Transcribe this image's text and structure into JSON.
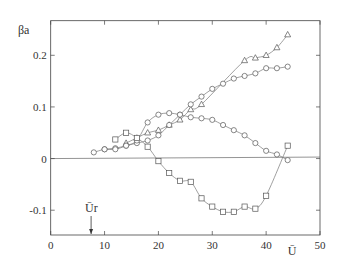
{
  "chart_data": {
    "type": "scatter",
    "title": "",
    "xlabel": "Ū",
    "ylabel": "βa",
    "xlim": [
      0,
      50
    ],
    "ylim": [
      -0.148,
      0.267
    ],
    "xticks": [
      0,
      10,
      20,
      30,
      40,
      50
    ],
    "xtick_labels": [
      "0",
      "10",
      "20",
      "30",
      "40",
      "50"
    ],
    "yticks": [
      -0.1,
      0,
      0.1,
      0.2
    ],
    "ytick_labels": [
      "-0.1",
      "0",
      "0.1",
      "0.2"
    ],
    "grid": false,
    "zero_line": true,
    "annotations": [
      {
        "text": "Ūr",
        "x": 7.5,
        "arrow": "down-to-x-axis"
      }
    ],
    "series": [
      {
        "name": "triangles",
        "marker": "triangle",
        "x": [
          14,
          16,
          18,
          20,
          22,
          24,
          26,
          28,
          36,
          38,
          40,
          42,
          44
        ],
        "y": [
          0.03,
          0.04,
          0.05,
          0.055,
          0.065,
          0.075,
          0.095,
          0.105,
          0.19,
          0.195,
          0.2,
          0.215,
          0.24
        ]
      },
      {
        "name": "circles-rising",
        "marker": "circle",
        "x": [
          8,
          10,
          12,
          14,
          16,
          18,
          20,
          22,
          24,
          26,
          28,
          30,
          32,
          34,
          36,
          38,
          40,
          42,
          44
        ],
        "y": [
          0.012,
          0.018,
          0.02,
          0.025,
          0.03,
          0.035,
          0.045,
          0.065,
          0.085,
          0.105,
          0.12,
          0.135,
          0.145,
          0.155,
          0.16,
          0.165,
          0.175,
          0.175,
          0.178
        ]
      },
      {
        "name": "circles-hump",
        "marker": "circle",
        "x": [
          10,
          12,
          14,
          16,
          18,
          20,
          22,
          24,
          26,
          28,
          30,
          32,
          34,
          36,
          38,
          40,
          42,
          44
        ],
        "y": [
          0.018,
          0.018,
          0.025,
          0.035,
          0.07,
          0.085,
          0.088,
          0.085,
          0.08,
          0.078,
          0.075,
          0.065,
          0.055,
          0.045,
          0.03,
          0.015,
          0.008,
          -0.003
        ]
      },
      {
        "name": "squares",
        "marker": "square",
        "x": [
          12,
          14,
          16,
          18,
          20,
          22,
          24,
          26,
          28,
          30,
          32,
          34,
          36,
          38,
          40,
          44
        ],
        "y": [
          0.037,
          0.05,
          0.04,
          0.023,
          -0.005,
          -0.028,
          -0.043,
          -0.045,
          -0.077,
          -0.093,
          -0.103,
          -0.103,
          -0.093,
          -0.097,
          -0.072,
          0.025
        ]
      }
    ]
  }
}
